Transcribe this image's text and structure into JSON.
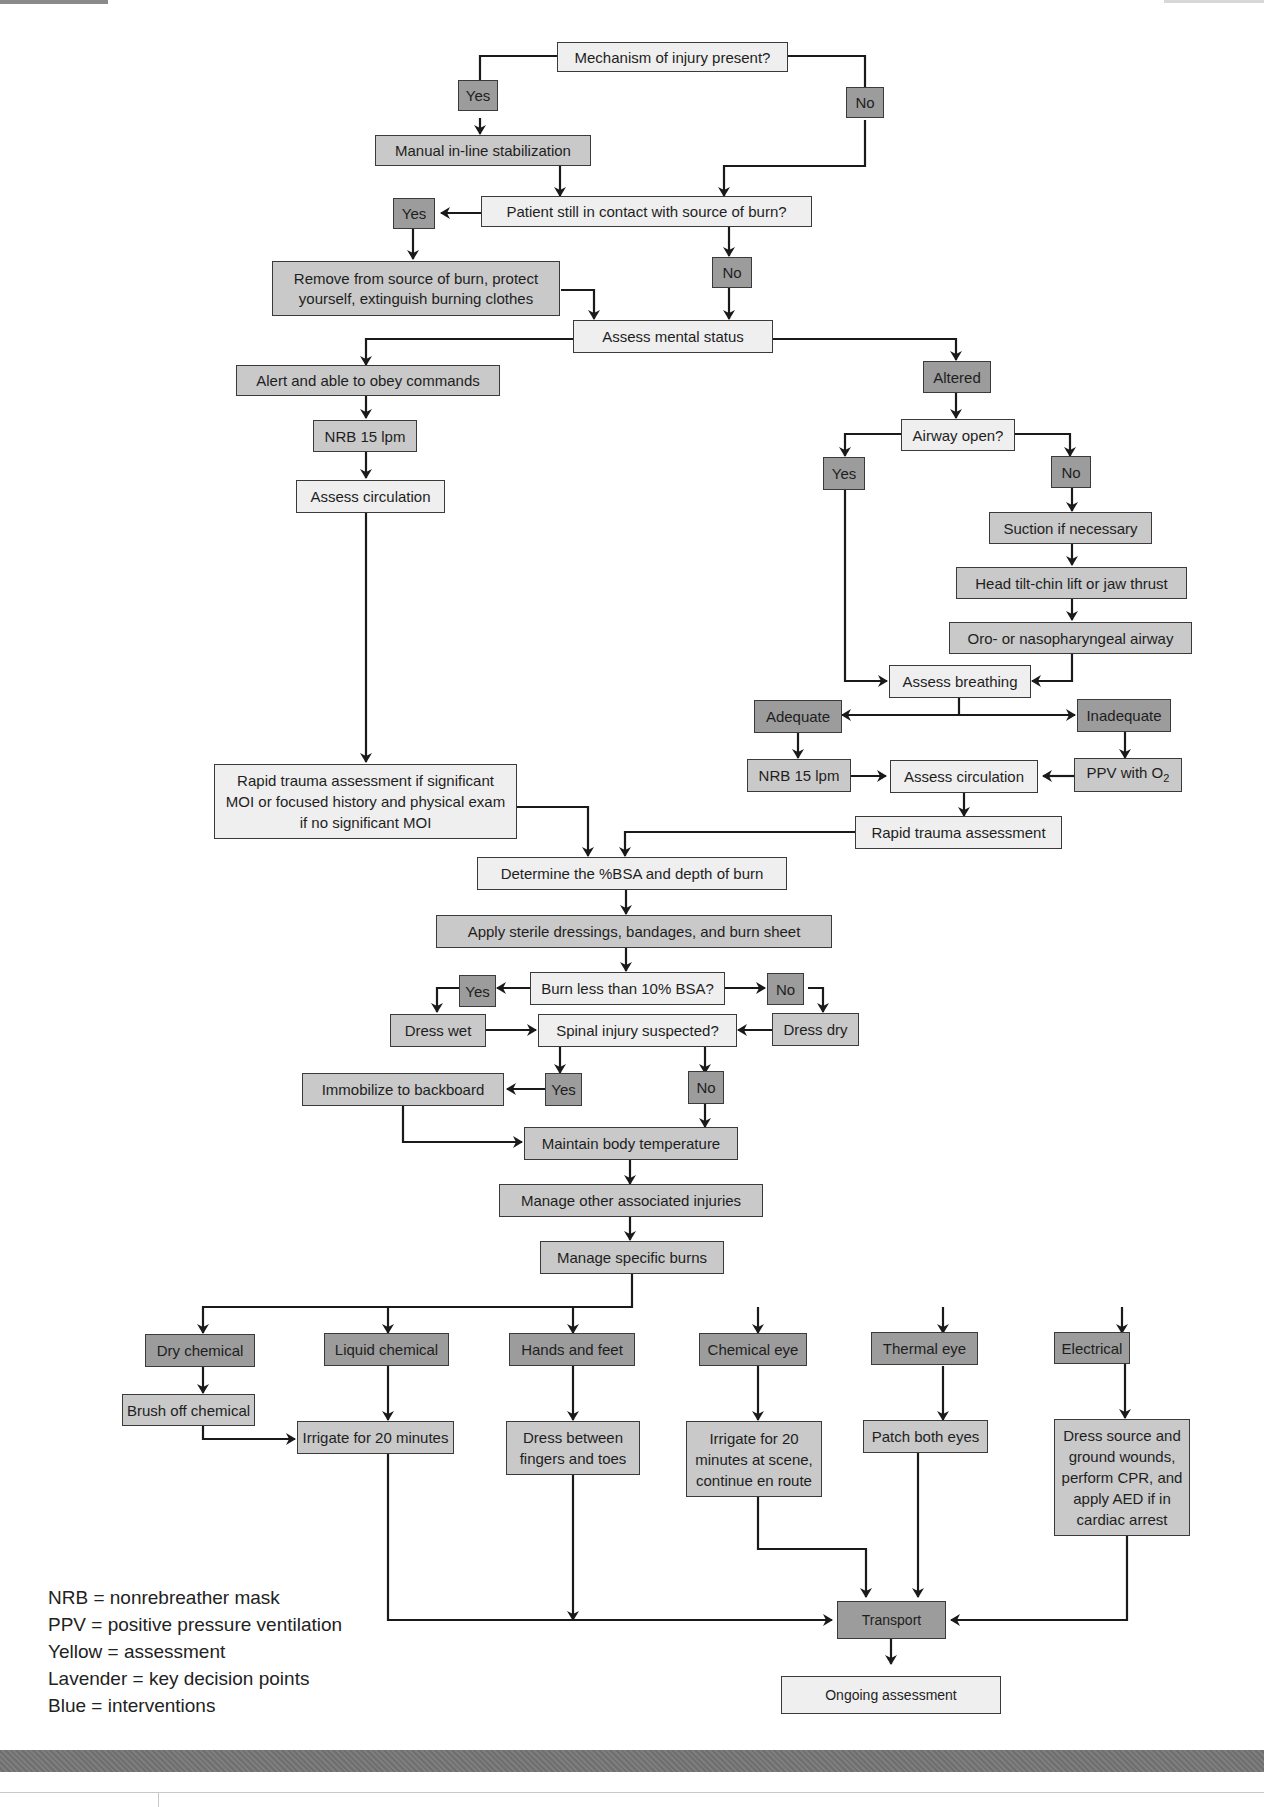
{
  "nodes": {
    "mechanism": "Mechanism of injury present?",
    "yes1": "Yes",
    "no1": "No",
    "manual_stab": "Manual in-line stabilization",
    "contact_q": "Patient still in contact with source of burn?",
    "yes2": "Yes",
    "no2": "No",
    "remove_source": "Remove from source of burn, protect yourself, extinguish burning clothes",
    "mental_status": "Assess mental status",
    "alert": "Alert and able to obey commands",
    "altered": "Altered",
    "nrb_left": "NRB 15 lpm",
    "assess_circ_left": "Assess circulation",
    "airway_q": "Airway open?",
    "yes_airway": "Yes",
    "no_airway": "No",
    "suction": "Suction if necessary",
    "head_tilt": "Head tilt-chin lift or jaw thrust",
    "oro_naso": "Oro- or nasopharyngeal airway",
    "assess_breathing": "Assess breathing",
    "adequate": "Adequate",
    "inadequate": "Inadequate",
    "nrb_right": "NRB 15 lpm",
    "assess_circ_right": "Assess circulation",
    "ppv_prefix": "PPV with O",
    "ppv_sub": "2",
    "rapid_trauma_right": "Rapid trauma assessment",
    "rapid_trauma_left": "Rapid trauma assessment if significant MOI or focused history and physical exam if no significant MOI",
    "determine_bsa": "Determine the %BSA and depth of burn",
    "apply_dressings": "Apply sterile dressings, bandages, and burn sheet",
    "burn_less_q": "Burn less than 10% BSA?",
    "yes_burn": "Yes",
    "no_burn": "No",
    "dress_wet": "Dress wet",
    "dress_dry": "Dress dry",
    "spinal_q": "Spinal injury suspected?",
    "yes_spinal": "Yes",
    "no_spinal": "No",
    "immobilize": "Immobilize to backboard",
    "maintain_temp": "Maintain body temperature",
    "manage_other": "Manage other associated injuries",
    "manage_specific": "Manage specific burns",
    "dry_chem": "Dry chemical",
    "liquid_chem": "Liquid chemical",
    "hands_feet": "Hands and feet",
    "chem_eye": "Chemical eye",
    "thermal_eye": "Thermal eye",
    "electrical": "Electrical",
    "brush_off": "Brush off chemical",
    "irrigate_20": "Irrigate for 20 minutes",
    "dress_between": "Dress between fingers and toes",
    "irrigate_scene": "Irrigate for 20 minutes at scene, continue en route",
    "patch_eyes": "Patch both eyes",
    "dress_source": "Dress source and ground wounds, perform CPR, and apply AED if in cardiac arrest",
    "transport": "Transport",
    "ongoing": "Ongoing assessment"
  },
  "legend": [
    "NRB = nonrebreather mask",
    "PPV = positive pressure ventilation",
    "Yellow = assessment",
    "Lavender = key decision points",
    "Blue = interventions"
  ],
  "colors": {
    "assessment": "#efefef",
    "intervention": "#c9c9c9",
    "decision": "#9c9c9c",
    "line": "#1a1a1a"
  }
}
